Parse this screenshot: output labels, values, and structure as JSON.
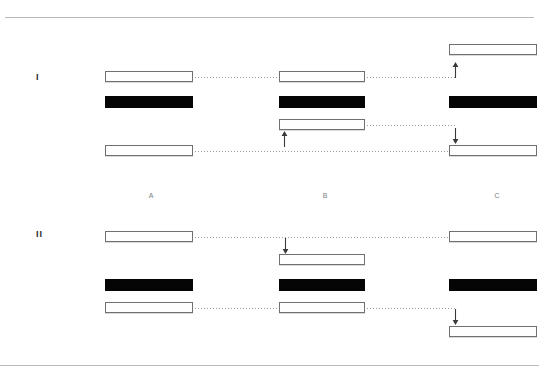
{
  "figure": {
    "background_color": "#ffffff",
    "rule_color": "#b9babc",
    "band_open_fill": "#fefefe",
    "band_open_stroke": "#6f7073",
    "band_filled_fill": "#050505",
    "connector_color": "#9b9c9e",
    "arrow_color": "#3a3a3a"
  },
  "rules": [
    {
      "name": "top-rule",
      "x": 5,
      "y": 17,
      "width": 529
    },
    {
      "name": "bottom-rule",
      "x": 0,
      "y": 365,
      "width": 539
    }
  ],
  "panels": [
    {
      "label": "I",
      "x": 36,
      "y": 72
    },
    {
      "label": "II",
      "x": 36,
      "y": 229
    }
  ],
  "lanes": [
    {
      "label": "A",
      "x": 151,
      "y": 191
    },
    {
      "label": "B",
      "x": 325,
      "y": 191
    },
    {
      "label": "C",
      "x": 497,
      "y": 191
    }
  ],
  "bands": [
    {
      "panel": "I",
      "lane": "A",
      "type": "open",
      "x": 105,
      "y": 71,
      "width": 88,
      "height": 11
    },
    {
      "panel": "I",
      "lane": "A",
      "type": "filled",
      "x": 105,
      "y": 96,
      "width": 88,
      "height": 12
    },
    {
      "panel": "I",
      "lane": "A",
      "type": "open",
      "x": 105,
      "y": 145,
      "width": 88,
      "height": 11
    },
    {
      "panel": "I",
      "lane": "B",
      "type": "open",
      "x": 279,
      "y": 71,
      "width": 86,
      "height": 11
    },
    {
      "panel": "I",
      "lane": "B",
      "type": "filled",
      "x": 279,
      "y": 96,
      "width": 86,
      "height": 12
    },
    {
      "panel": "I",
      "lane": "B",
      "type": "open",
      "x": 279,
      "y": 119,
      "width": 86,
      "height": 11
    },
    {
      "panel": "I",
      "lane": "C",
      "type": "open",
      "x": 449,
      "y": 44,
      "width": 88,
      "height": 11
    },
    {
      "panel": "I",
      "lane": "C",
      "type": "filled",
      "x": 449,
      "y": 96,
      "width": 88,
      "height": 12
    },
    {
      "panel": "I",
      "lane": "C",
      "type": "open",
      "x": 449,
      "y": 145,
      "width": 88,
      "height": 11
    },
    {
      "panel": "II",
      "lane": "A",
      "type": "open",
      "x": 105,
      "y": 231,
      "width": 88,
      "height": 11
    },
    {
      "panel": "II",
      "lane": "A",
      "type": "filled",
      "x": 105,
      "y": 279,
      "width": 88,
      "height": 12
    },
    {
      "panel": "II",
      "lane": "A",
      "type": "open",
      "x": 105,
      "y": 302,
      "width": 88,
      "height": 11
    },
    {
      "panel": "II",
      "lane": "B",
      "type": "open",
      "x": 279,
      "y": 254,
      "width": 86,
      "height": 11
    },
    {
      "panel": "II",
      "lane": "B",
      "type": "filled",
      "x": 279,
      "y": 279,
      "width": 86,
      "height": 12
    },
    {
      "panel": "II",
      "lane": "B",
      "type": "open",
      "x": 279,
      "y": 302,
      "width": 86,
      "height": 11
    },
    {
      "panel": "II",
      "lane": "C",
      "type": "open",
      "x": 449,
      "y": 231,
      "width": 88,
      "height": 11
    },
    {
      "panel": "II",
      "lane": "C",
      "type": "filled",
      "x": 449,
      "y": 279,
      "width": 88,
      "height": 12
    },
    {
      "panel": "II",
      "lane": "C",
      "type": "open",
      "x": 449,
      "y": 326,
      "width": 88,
      "height": 11
    }
  ],
  "connectors": [
    {
      "panel": "I",
      "from_lane": "A",
      "to_lane": "B",
      "x": 195,
      "y": 77,
      "width": 82
    },
    {
      "panel": "I",
      "from_lane": "B",
      "to_lane": "C",
      "x": 367,
      "y": 77,
      "width": 88
    },
    {
      "panel": "I",
      "from_lane": "B",
      "to_lane": "C",
      "x": 367,
      "y": 125,
      "width": 88
    },
    {
      "panel": "I",
      "from_lane": "A",
      "to_lane": "C",
      "x": 195,
      "y": 151,
      "width": 253
    },
    {
      "panel": "II",
      "from_lane": "A",
      "to_lane": "C",
      "x": 195,
      "y": 237,
      "width": 253
    },
    {
      "panel": "II",
      "from_lane": "A",
      "to_lane": "B",
      "x": 195,
      "y": 308,
      "width": 82
    },
    {
      "panel": "II",
      "from_lane": "B",
      "to_lane": "C",
      "x": 367,
      "y": 308,
      "width": 88
    }
  ],
  "arrows": [
    {
      "panel": "I",
      "lane": "C",
      "direction": "up",
      "x": 451,
      "y": 62,
      "height": 16
    },
    {
      "panel": "I",
      "lane": "B",
      "direction": "up",
      "x": 280,
      "y": 131,
      "height": 16
    },
    {
      "panel": "I",
      "lane": "C",
      "direction": "down",
      "x": 451,
      "y": 128,
      "height": 16
    },
    {
      "panel": "II",
      "lane": "B",
      "direction": "down",
      "x": 281,
      "y": 238,
      "height": 16
    },
    {
      "panel": "II",
      "lane": "C",
      "direction": "down",
      "x": 451,
      "y": 309,
      "height": 16
    }
  ]
}
